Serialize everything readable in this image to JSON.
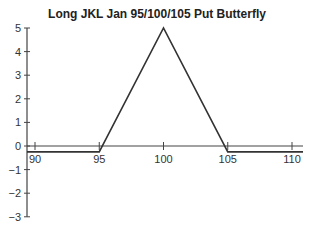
{
  "chart_data": {
    "type": "line",
    "title": "Long JKL Jan 95/100/105 Put Butterfly",
    "xlabel": "",
    "ylabel": "",
    "x_ticks": [
      90,
      95,
      100,
      105,
      110
    ],
    "y_ticks": [
      5,
      4,
      3,
      2,
      1,
      0,
      -1,
      -2,
      -3
    ],
    "y_tick_labels": [
      "5",
      "4",
      "3",
      "2",
      "1",
      "0",
      "−1",
      "−2",
      "−3"
    ],
    "xlim": [
      88.5,
      111
    ],
    "ylim": [
      -3,
      5
    ],
    "grid": false,
    "legend": null,
    "series": [
      {
        "name": "Payoff at expiration",
        "x": [
          88.5,
          95,
          100,
          105,
          111
        ],
        "y": [
          -0.25,
          -0.25,
          5,
          -0.25,
          -0.25
        ],
        "color": "#333333"
      }
    ]
  }
}
